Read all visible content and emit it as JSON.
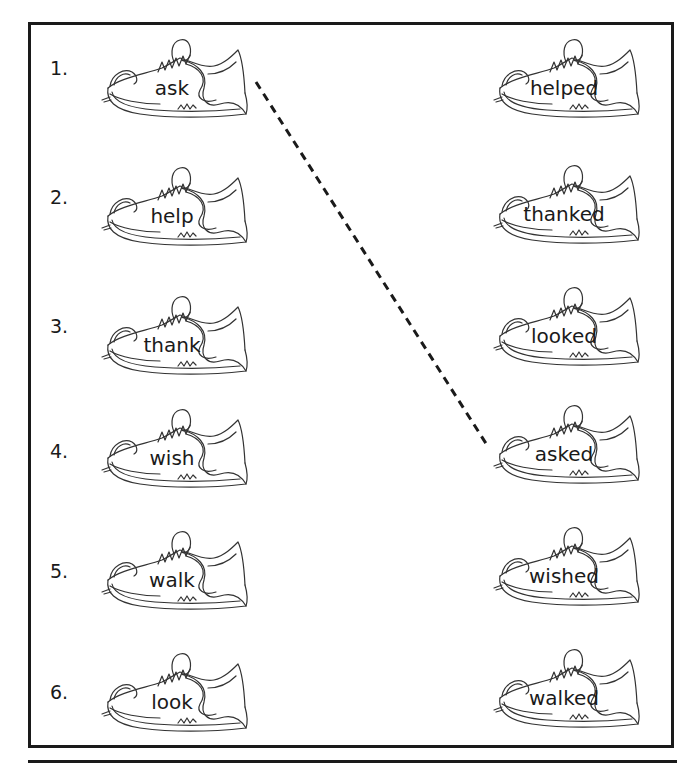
{
  "worksheet": {
    "left_column": {
      "items": [
        {
          "number": "1.",
          "word": "ask"
        },
        {
          "number": "2.",
          "word": "help"
        },
        {
          "number": "3.",
          "word": "thank"
        },
        {
          "number": "4.",
          "word": "wish"
        },
        {
          "number": "5.",
          "word": "walk"
        },
        {
          "number": "6.",
          "word": "look"
        }
      ]
    },
    "right_column": {
      "items": [
        {
          "word": "helped"
        },
        {
          "word": "thanked"
        },
        {
          "word": "looked"
        },
        {
          "word": "asked"
        },
        {
          "word": "wished"
        },
        {
          "word": "walked"
        }
      ]
    },
    "example_match": {
      "from": "ask",
      "to": "asked",
      "style": "dashed"
    },
    "colors": {
      "ink": "#1a1a1a",
      "paper": "#ffffff",
      "shoe_outline": "#333333"
    }
  }
}
